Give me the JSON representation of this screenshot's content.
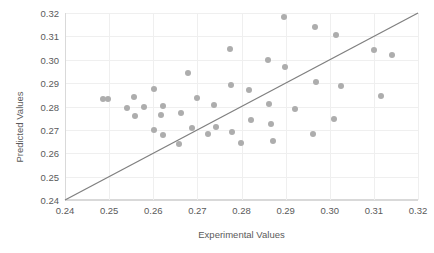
{
  "chart_data": {
    "type": "scatter",
    "title": "",
    "xlabel": "Experimental Values",
    "ylabel": "Predicted Values",
    "xlim": [
      0.24,
      0.32
    ],
    "ylim": [
      0.24,
      0.32
    ],
    "xticks": [
      "0.24",
      "0.25",
      "0.26",
      "0.27",
      "0.28",
      "0.29",
      "0.30",
      "0.31",
      "0.32"
    ],
    "xtick_values": [
      0.24,
      0.25,
      0.26,
      0.27,
      0.28,
      0.29,
      0.3,
      0.31,
      0.32
    ],
    "yticks": [
      "0.24",
      "0.25",
      "0.26",
      "0.27",
      "0.28",
      "0.29",
      "0.30",
      "0.31",
      "0.32"
    ],
    "ytick_values": [
      0.24,
      0.25,
      0.26,
      0.27,
      0.28,
      0.29,
      0.3,
      0.31,
      0.32
    ],
    "grid": true,
    "legend": false,
    "legend_position": "none",
    "marker_color": "#adadad",
    "line_color": "#808080",
    "gridline_color": "#efefef",
    "axis_color": "#d9d9d9",
    "text_color": "#5a5a5a",
    "reference_line": {
      "label": "1:1 parity line",
      "x": [
        0.24,
        0.32
      ],
      "y": [
        0.24,
        0.32
      ]
    },
    "points": [
      {
        "x": 0.2487,
        "y": 0.2832
      },
      {
        "x": 0.2498,
        "y": 0.2833
      },
      {
        "x": 0.254,
        "y": 0.2794
      },
      {
        "x": 0.2556,
        "y": 0.284
      },
      {
        "x": 0.2559,
        "y": 0.2761
      },
      {
        "x": 0.2578,
        "y": 0.2796
      },
      {
        "x": 0.2602,
        "y": 0.2876
      },
      {
        "x": 0.2601,
        "y": 0.27
      },
      {
        "x": 0.2618,
        "y": 0.2763
      },
      {
        "x": 0.2622,
        "y": 0.2802
      },
      {
        "x": 0.2623,
        "y": 0.268
      },
      {
        "x": 0.2658,
        "y": 0.2641
      },
      {
        "x": 0.2663,
        "y": 0.2772
      },
      {
        "x": 0.2679,
        "y": 0.2942
      },
      {
        "x": 0.2688,
        "y": 0.2706
      },
      {
        "x": 0.2699,
        "y": 0.2836
      },
      {
        "x": 0.2723,
        "y": 0.2683
      },
      {
        "x": 0.2738,
        "y": 0.2806
      },
      {
        "x": 0.2742,
        "y": 0.2711
      },
      {
        "x": 0.2775,
        "y": 0.3045
      },
      {
        "x": 0.2777,
        "y": 0.289
      },
      {
        "x": 0.2779,
        "y": 0.2692
      },
      {
        "x": 0.2798,
        "y": 0.2645
      },
      {
        "x": 0.2818,
        "y": 0.287
      },
      {
        "x": 0.2821,
        "y": 0.2743
      },
      {
        "x": 0.2859,
        "y": 0.3001
      },
      {
        "x": 0.2862,
        "y": 0.281
      },
      {
        "x": 0.2866,
        "y": 0.2726
      },
      {
        "x": 0.2872,
        "y": 0.2652
      },
      {
        "x": 0.2897,
        "y": 0.3182
      },
      {
        "x": 0.2899,
        "y": 0.297
      },
      {
        "x": 0.2921,
        "y": 0.2791
      },
      {
        "x": 0.2962,
        "y": 0.2684
      },
      {
        "x": 0.2967,
        "y": 0.3138
      },
      {
        "x": 0.2969,
        "y": 0.2903
      },
      {
        "x": 0.3009,
        "y": 0.2748
      },
      {
        "x": 0.3014,
        "y": 0.3106
      },
      {
        "x": 0.3026,
        "y": 0.2886
      },
      {
        "x": 0.31,
        "y": 0.3041
      },
      {
        "x": 0.3117,
        "y": 0.2845
      },
      {
        "x": 0.314,
        "y": 0.3019
      }
    ]
  }
}
